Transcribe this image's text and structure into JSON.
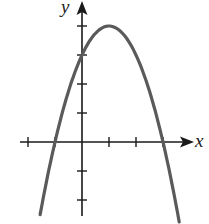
{
  "figure": {
    "part_label": ")",
    "x_axis_label": "x",
    "y_axis_label": "y",
    "colors": {
      "axis": "#1a1a1a",
      "curve": "#5a5a5a",
      "background": "#ffffff"
    }
  },
  "chart_data": {
    "type": "line",
    "title": "",
    "xlabel": "x",
    "ylabel": "y",
    "function": "y = -x^2 + 2x + 3 = -(x+1)(x-3)",
    "x_ticks": [
      -2,
      -1,
      1,
      2,
      3
    ],
    "y_ticks": [
      -2,
      -1,
      1,
      2,
      3,
      4
    ],
    "tick_labels_shown": false,
    "xlim": [
      -2.1,
      4.1
    ],
    "ylim": [
      -2.6,
      5.0
    ],
    "grid": false,
    "key_points": {
      "vertex": [
        1,
        4
      ],
      "x_intercepts": [
        [
          -1,
          0
        ],
        [
          3,
          0
        ]
      ],
      "y_intercept": [
        0,
        3
      ]
    },
    "series": [
      {
        "name": "parabola",
        "x": [
          -1.55,
          -1,
          -0.5,
          0,
          0.5,
          1,
          1.5,
          2,
          2.5,
          3,
          3.5,
          3.6
        ],
        "y": [
          -2.5,
          0,
          1.75,
          3,
          3.75,
          4,
          3.75,
          3,
          1.75,
          0,
          -2.25,
          -2.76
        ]
      }
    ]
  }
}
